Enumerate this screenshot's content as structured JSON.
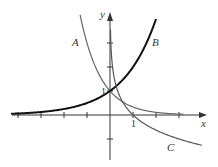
{
  "chart_data": {
    "type": "line",
    "title": "",
    "xlabel": "x",
    "ylabel": "y",
    "xlim": [
      -4.3,
      4.2
    ],
    "ylim": [
      -1.9,
      4.2
    ],
    "grid": false,
    "legend": "none (curves labeled inline)",
    "x_ticks": [
      -4,
      -3,
      -2,
      -1,
      1,
      2,
      3
    ],
    "y_ticks": [
      -1,
      1,
      2,
      3
    ],
    "tick_labels": {
      "x": [
        "1"
      ],
      "y": [
        "1"
      ]
    },
    "series": [
      {
        "name": "A",
        "function": "(1/3)^x",
        "label_pos": [
          -1.5,
          3.0
        ],
        "x_range": [
          -1.3,
          3.2
        ],
        "color": "#666666",
        "width": 1.2
      },
      {
        "name": "B",
        "function": "2^x",
        "label_pos": [
          1.95,
          3.05
        ],
        "x_range": [
          -4.3,
          2.0
        ],
        "color": "#111111",
        "width": 2
      },
      {
        "name": "C",
        "function": "log_{1/3}(x)",
        "label_pos": [
          2.6,
          -1.35
        ],
        "x_range": [
          0.02,
          4.0
        ],
        "color": "#555555",
        "width": 1.2
      }
    ],
    "annotations": [
      {
        "text": "1",
        "at": "y-axis, y=1"
      },
      {
        "text": "1",
        "at": "x-axis, x=1"
      }
    ]
  },
  "labels": {
    "x_axis": "x",
    "y_axis": "y",
    "x_one": "1",
    "y_one": "1",
    "curve_a": "A",
    "curve_b": "B",
    "curve_c": "C"
  }
}
